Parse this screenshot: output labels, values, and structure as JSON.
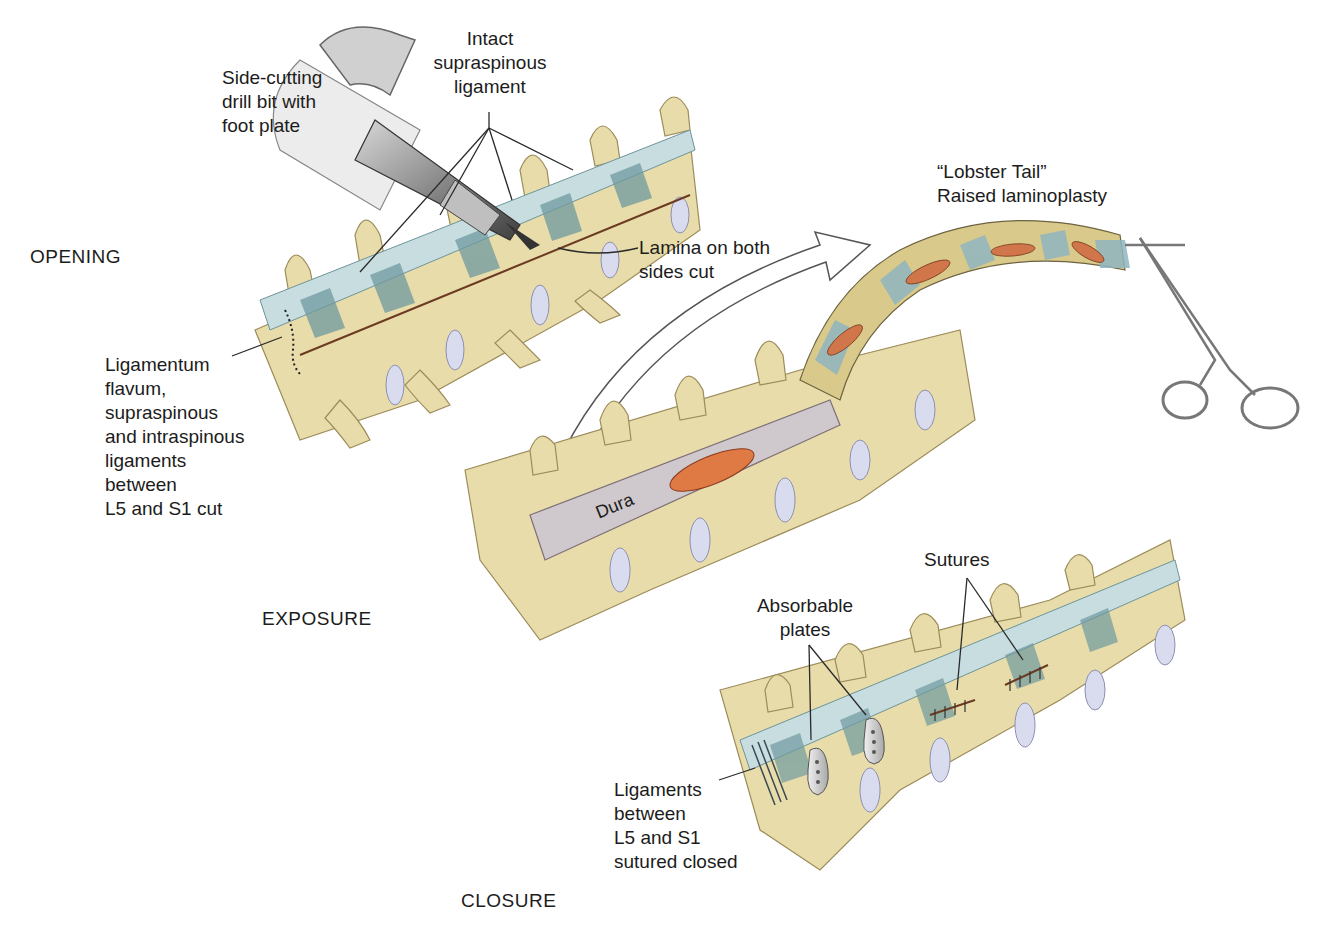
{
  "figure": {
    "stages": {
      "opening": "OPENING",
      "exposure": "EXPOSURE",
      "closure": "CLOSURE"
    },
    "labels": {
      "drill": "Side-cutting\ndrill bit with\nfoot plate",
      "intact_ligament": "Intact\nsupraspinous\nligament",
      "lamina_cut": "Lamina on both\nsides cut",
      "ligaments_cut": "Ligamentum\nflavum,\nsupraspinous\nand intraspinous\nligaments\nbetween\nL5 and S1 cut",
      "lobster_tail": "“Lobster Tail”\nRaised laminoplasty",
      "dura": "Dura",
      "absorbable_plates": "Absorbable\nplates",
      "sutures": "Sutures",
      "ligaments_sutured": "Ligaments\nbetween\nL5 and S1\nsutured closed"
    },
    "colors": {
      "bone": "#e8dcaa",
      "bone_dark": "#c9b77a",
      "ligament": "#a9c6cc",
      "ligament_dark": "#5f8a90",
      "disc": "#d9dcef",
      "dura": "#cfc8cc",
      "cord_exposed": "#e07a45",
      "metal": "#8a8a8a",
      "arrow_outline": "#555555"
    }
  }
}
